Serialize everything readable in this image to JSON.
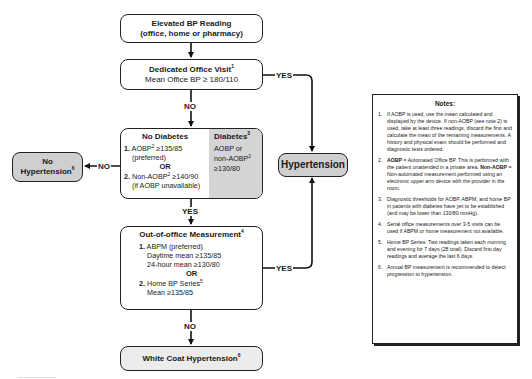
{
  "flowchart": {
    "elevated": {
      "title": "Elevated BP Reading",
      "subtitle": "(office, home or pharmacy)"
    },
    "dedicated": {
      "title": "Dedicated Office Visit",
      "title_sup": "1",
      "subtitle": "Mean Office BP  ≥ 180/110"
    },
    "no_diabetes": {
      "title": "No Diabetes",
      "item1_num": "1.",
      "item1_a": "AOBP",
      "item1_sup": "2",
      "item1_b": " ≥135/85",
      "item1_c": "(preferred)",
      "or": "OR",
      "item2_num": "2.",
      "item2_a": "Non-AOBP",
      "item2_sup": "2",
      "item2_b": " ≥140/90",
      "item2_c": "(if AOBP unavailable)"
    },
    "diabetes": {
      "title": "Diabetes",
      "title_sup": "3",
      "line1": "AOBP or",
      "line2": "non-AOBP",
      "line2_sup": "2",
      "line3": "≥130/80"
    },
    "no_hypertension": {
      "line1": "No",
      "line2": "Hypertension",
      "sup": "6"
    },
    "hypertension": {
      "label": "Hypertension"
    },
    "out_of_office": {
      "title": "Out-of-office Measurement",
      "title_sup": "4",
      "item1_num": "1.",
      "item1_a": "ABPM (preferred)",
      "item1_b": "Daytime mean ≥135/85",
      "item1_c": "24-hour mean ≥130/80",
      "or": "OR",
      "item2_num": "2.",
      "item2_a": "Home BP Series",
      "item2_sup": "5",
      "item2_b": "Mean ≥135/85"
    },
    "white_coat": {
      "label": "White Coat Hypertension",
      "sup": "6"
    },
    "labels": {
      "no": "NO",
      "yes": "YES"
    }
  },
  "notes": {
    "title": "Notes:",
    "items": [
      {
        "num": "1.",
        "text": "If AOBP is used, use the mean calculated and displayed by the device. If non-AOBP (see note 2) is used, take at least three readings, discard the first and calculate the mean of the remaining measurements. A history and physical exam should be performed and diagnostic tests ordered."
      },
      {
        "num": "2.",
        "bold1": "AOBP",
        "text1": " = Automated Office BP. This is performed with the patient unattended in a private area. ",
        "bold2": "Non-AOBP",
        "text2": " = Non-automated measurement performed using an electronic upper arm device with the provider in the room."
      },
      {
        "num": "3.",
        "text": "Diagnostic thresholds for AOBP, ABPM, and home BP in patients with diabetes have yet to be established (and may be lower than 130/80 mmHg)."
      },
      {
        "num": "4.",
        "text": "Serial office measurements over 3-5 visits can be used if ABPM or home measurement not available."
      },
      {
        "num": "5.",
        "text": "Home BP Series: Two readings taken each morning and evening for 7 days (28 total). Discard first day readings and average the last 6 days."
      },
      {
        "num": "6.",
        "text": "Annual BP measurement is recommended to detect progression to hypertension."
      }
    ]
  }
}
